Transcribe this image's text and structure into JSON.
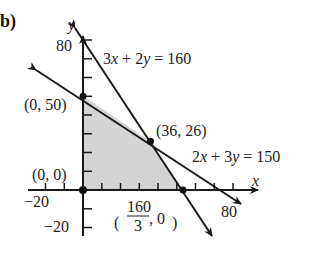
{
  "part_label": "b)",
  "axes": {
    "x_label": "x",
    "y_label": "y",
    "x_ticks": [
      "−20",
      "80"
    ],
    "y_ticks": [
      "80",
      "−20"
    ],
    "tick_step": 10
  },
  "lines": [
    {
      "name": "3x + 2y = 160",
      "parts": [
        "3",
        "x",
        " + 2",
        "y",
        " = 160"
      ]
    },
    {
      "name": "2x + 3y = 150",
      "parts": [
        "2",
        "x",
        " + 3",
        "y",
        " = 150"
      ]
    }
  ],
  "vertices": [
    {
      "label": "(0, 50)",
      "x": 0,
      "y": 50
    },
    {
      "label": "(36, 26)",
      "x": 36,
      "y": 26
    },
    {
      "label": "(0, 0)",
      "x": 0,
      "y": 0
    },
    {
      "label_num": "160",
      "label_den": "3",
      "label_rest": ", 0",
      "x": 53.33,
      "y": 0
    }
  ],
  "feasible_region_color": "#d4d4d4"
}
